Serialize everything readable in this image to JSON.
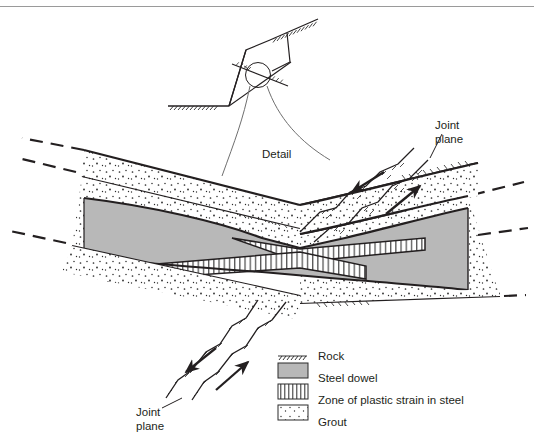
{
  "figure": {
    "title_visible": false,
    "background": "#ffffff",
    "rule_color": "#9a9a9a",
    "ink_color": "#231f20",
    "steel_fill": "#b8b8b8",
    "grout_fill": "#ffffff",
    "strain_fill": "#ffffff"
  },
  "labels": {
    "detail": "Detail",
    "joint_plane_top_right": "Joint\nplane",
    "joint_plane_top_right_line1": "Joint",
    "joint_plane_top_right_line2": "plane",
    "joint_plane_bottom_left_line1": "Joint",
    "joint_plane_bottom_left_line2": "plane"
  },
  "legend": {
    "items": [
      {
        "key": "rock",
        "label": "Rock",
        "swatch": "hatched-line-icon",
        "color": "#231f20"
      },
      {
        "key": "steel",
        "label": "Steel dowel",
        "swatch": "gray-fill-icon",
        "color": "#b8b8b8"
      },
      {
        "key": "strain",
        "label": "Zone of plastic strain in steel",
        "swatch": "vertical-hatch-icon",
        "color": "#ffffff"
      },
      {
        "key": "grout",
        "label": "Grout",
        "swatch": "stipple-icon",
        "color": "#ffffff"
      }
    ]
  },
  "annotations": {
    "shear_arrows": [
      {
        "name": "shear-arrow-upper-left",
        "direction": "down-left"
      },
      {
        "name": "shear-arrow-upper-right",
        "direction": "up-right"
      },
      {
        "name": "shear-arrow-lower-left",
        "direction": "down-left"
      },
      {
        "name": "shear-arrow-lower-right",
        "direction": "up-right"
      }
    ],
    "detail_callout": {
      "name": "detail-callout",
      "shape": "flared-leader-lines"
    },
    "inset": {
      "name": "slope-wedge-inset",
      "ground_surface": "hatched",
      "slope_face": "hatched",
      "detail_circle": true
    }
  }
}
